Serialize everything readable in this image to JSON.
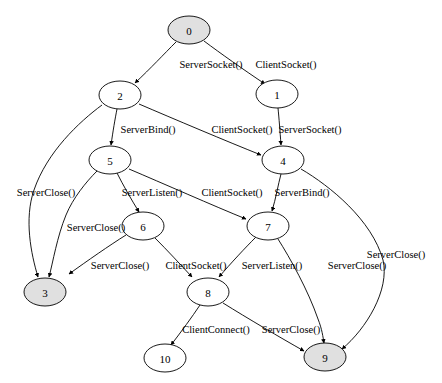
{
  "diagram": {
    "type": "directed-graph",
    "width": 442,
    "height": 383,
    "background_color": "#ffffff",
    "node_fill_accepting": "#e0e0e0",
    "node_fill_default": "#ffffff",
    "node_stroke_color": "#000000",
    "edge_color": "#000000",
    "label_color": "#000000"
  },
  "nodes": [
    {
      "id": "0",
      "label": "0",
      "cx": 189,
      "cy": 30,
      "rx": 21,
      "ry": 14,
      "fill": "#e0e0e0"
    },
    {
      "id": "1",
      "label": "1",
      "cx": 277,
      "cy": 94,
      "rx": 21,
      "ry": 14,
      "fill": "#ffffff"
    },
    {
      "id": "2",
      "label": "2",
      "cx": 120,
      "cy": 95,
      "rx": 21,
      "ry": 14,
      "fill": "#ffffff"
    },
    {
      "id": "3",
      "label": "3",
      "cx": 45,
      "cy": 292,
      "rx": 21,
      "ry": 14,
      "fill": "#e0e0e0"
    },
    {
      "id": "4",
      "label": "4",
      "cx": 283,
      "cy": 160,
      "rx": 21,
      "ry": 14,
      "fill": "#ffffff"
    },
    {
      "id": "5",
      "label": "5",
      "cx": 110,
      "cy": 160,
      "rx": 21,
      "ry": 14,
      "fill": "#ffffff"
    },
    {
      "id": "6",
      "label": "6",
      "cx": 143,
      "cy": 226,
      "rx": 21,
      "ry": 14,
      "fill": "#ffffff"
    },
    {
      "id": "7",
      "label": "7",
      "cx": 268,
      "cy": 226,
      "rx": 21,
      "ry": 14,
      "fill": "#ffffff"
    },
    {
      "id": "8",
      "label": "8",
      "cx": 208,
      "cy": 292,
      "rx": 21,
      "ry": 14,
      "fill": "#ffffff"
    },
    {
      "id": "9",
      "label": "9",
      "cx": 325,
      "cy": 357,
      "rx": 21,
      "ry": 14,
      "fill": "#e0e0e0"
    },
    {
      "id": "10",
      "label": "10",
      "cx": 165,
      "cy": 358,
      "rx": 21,
      "ry": 14,
      "fill": "#ffffff"
    }
  ],
  "edges": [
    {
      "id": "e0",
      "from": "0",
      "to": "2",
      "label": "ServerSocket()",
      "label_x": 211,
      "label_y": 64,
      "path": "M 176,42 C 164,54 151,68 135,83"
    },
    {
      "id": "e1",
      "from": "0",
      "to": "1",
      "label": "ClientSocket()",
      "label_x": 286,
      "label_y": 64,
      "path": "M 204,41 C 220,53 244,70 265,84"
    },
    {
      "id": "e2",
      "from": "2",
      "to": "5",
      "label": "ServerBind()",
      "label_x": 148,
      "label_y": 129,
      "path": "M 117,109 C 115,119 113,131 111,145"
    },
    {
      "id": "e3",
      "from": "2",
      "to": "4",
      "label": "ClientSocket()",
      "label_x": 242,
      "label_y": 129,
      "path": "M 139,104 C 174,119 226,141 261,155"
    },
    {
      "id": "e4",
      "from": "1",
      "to": "4",
      "label": "ServerSocket()",
      "label_x": 310,
      "label_y": 129,
      "path": "M 278,108 C 279,118 280,131 281,145"
    },
    {
      "id": "e5",
      "from": "2",
      "to": "3",
      "label": "ServerClose()",
      "label_x": 46,
      "label_y": 192,
      "path": "M 102,105 C 79,122 47,152 34,190 C 24,219 31,254 38,277"
    },
    {
      "id": "e6",
      "from": "5",
      "to": "6",
      "label": "ServerListen()",
      "label_x": 152,
      "label_y": 192,
      "path": "M 117,173 C 123,185 131,199 139,212"
    },
    {
      "id": "e7",
      "from": "5",
      "to": "7",
      "label": "ClientSocket()",
      "label_x": 232,
      "label_y": 192,
      "path": "M 129,169 C 162,183 214,206 246,219"
    },
    {
      "id": "e8",
      "from": "4",
      "to": "7",
      "label": "ServerBind()",
      "label_x": 302,
      "label_y": 192,
      "path": "M 281,174 C 278,185 276,198 272,211"
    },
    {
      "id": "e9",
      "from": "5",
      "to": "3",
      "label": "ServerClose()",
      "label_x": 96,
      "label_y": 227,
      "path": "M 97,171 C 86,182 73,198 66,215 C 57,237 53,262 49,277"
    },
    {
      "id": "e10",
      "from": "6",
      "to": "3",
      "label": "ServerClose()",
      "label_x": 120,
      "label_y": 265,
      "path": "M 126,235 C 110,245 87,261 69,274"
    },
    {
      "id": "e11",
      "from": "6",
      "to": "8",
      "label": "ClientSocket()",
      "label_x": 196,
      "label_y": 265,
      "path": "M 155,238 C 167,250 180,264 192,277"
    },
    {
      "id": "e12",
      "from": "7",
      "to": "8",
      "label": "ServerListen()",
      "label_x": 272,
      "label_y": 265,
      "path": "M 256,237 C 245,248 231,263 219,277"
    },
    {
      "id": "e13",
      "from": "7",
      "to": "9",
      "label": "ServerClose()",
      "label_x": 357,
      "label_y": 265,
      "path": "M 278,239 C 290,258 308,290 318,319 C 322,329 323,337 324,343"
    },
    {
      "id": "e14",
      "from": "4",
      "to": "9",
      "label": "ServerClose()",
      "label_x": 396,
      "label_y": 254,
      "path": "M 301,169 C 330,186 372,220 383,260 C 390,290 366,329 342,349"
    },
    {
      "id": "e15",
      "from": "8",
      "to": "10",
      "label": "ClientConnect()",
      "label_x": 216,
      "label_y": 329,
      "path": "M 200,305 C 192,317 181,332 171,345"
    },
    {
      "id": "e16",
      "from": "8",
      "to": "9",
      "label": "ServerClose()",
      "label_x": 291,
      "label_y": 329,
      "path": "M 223,303 C 247,318 281,338 304,351"
    }
  ]
}
